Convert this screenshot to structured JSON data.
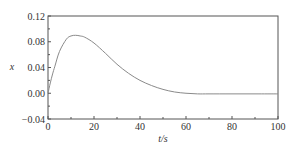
{
  "chart_data": {
    "type": "line",
    "title": "",
    "xlabel": "t/s",
    "ylabel": "x",
    "xlim": [
      0,
      100
    ],
    "ylim": [
      -0.04,
      0.12
    ],
    "grid": false,
    "legend": null,
    "x_ticks": [
      "0",
      "20",
      "40",
      "60",
      "80",
      "100"
    ],
    "y_ticks": [
      "0.12",
      "0.08",
      "0.04",
      "0.00",
      "-0.04"
    ],
    "series": [
      {
        "name": "x",
        "color": "#8a8a8a",
        "x": [
          0,
          1,
          2,
          3,
          5,
          8,
          10,
          12,
          14,
          16,
          20,
          25,
          30,
          35,
          40,
          45,
          50,
          55,
          60,
          65,
          70,
          80,
          90,
          100
        ],
        "y": [
          0.0,
          0.016,
          0.03,
          0.042,
          0.065,
          0.084,
          0.089,
          0.09,
          0.089,
          0.087,
          0.078,
          0.062,
          0.045,
          0.031,
          0.02,
          0.012,
          0.006,
          0.002,
          0.0,
          -0.001,
          -0.001,
          -0.001,
          -0.001,
          -0.001
        ]
      }
    ]
  }
}
